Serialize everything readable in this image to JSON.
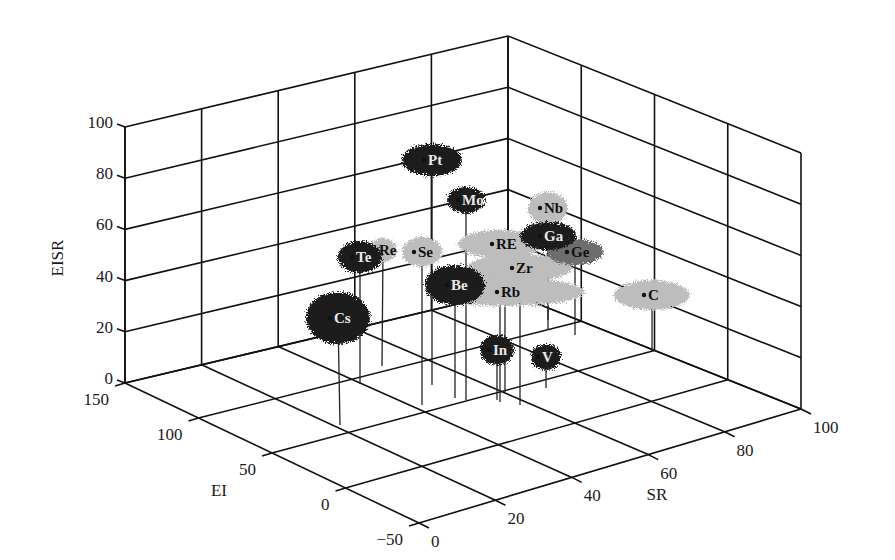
{
  "chart_data": {
    "type": "scatter3d",
    "title": "",
    "xlabel": "SR",
    "ylabel": "EI",
    "zlabel": "EISR",
    "xlim": [
      0,
      100
    ],
    "ylim": [
      -50,
      150
    ],
    "zlim": [
      0,
      100
    ],
    "x_ticks": [
      "0",
      "20",
      "40",
      "60",
      "80",
      "100"
    ],
    "y_ticks": [
      "-50",
      "0",
      "50",
      "100",
      "150"
    ],
    "z_ticks": [
      "0",
      "20",
      "40",
      "60",
      "80",
      "100"
    ],
    "grid": true,
    "legend": null,
    "series_note": "dark clusters and light-gray clusters; each element shown as a fuzzy blob with a drop line to the floor",
    "points": [
      {
        "label": "Pt",
        "shade": "dark",
        "sx": 432,
        "sy": 160,
        "rx": 30,
        "ry": 16,
        "fx": 432,
        "fy": 385
      },
      {
        "label": "Mo",
        "shade": "dark",
        "sx": 466,
        "sy": 200,
        "rx": 19,
        "ry": 13,
        "fx": 466,
        "fy": 400
      },
      {
        "label": "Nb",
        "shade": "light",
        "sx": 548,
        "sy": 208,
        "rx": 20,
        "ry": 16,
        "fx": 548,
        "fy": 330
      },
      {
        "label": "Ga",
        "shade": "dark",
        "sx": 548,
        "sy": 236,
        "rx": 28,
        "ry": 14,
        "fx": 548,
        "fy": 320
      },
      {
        "label": "Ge",
        "shade": "mid",
        "sx": 575,
        "sy": 252,
        "rx": 28,
        "ry": 13,
        "fx": 575,
        "fy": 335
      },
      {
        "label": "RE",
        "shade": "light",
        "sx": 500,
        "sy": 244,
        "rx": 42,
        "ry": 14,
        "fx": 500,
        "fy": 402
      },
      {
        "label": "Te",
        "shade": "dark",
        "sx": 360,
        "sy": 257,
        "rx": 22,
        "ry": 16,
        "fx": 360,
        "fy": 384
      },
      {
        "label": "Re",
        "shade": "light",
        "sx": 383,
        "sy": 250,
        "rx": 14,
        "ry": 12,
        "fx": 382,
        "fy": 366
      },
      {
        "label": "Se",
        "shade": "light",
        "sx": 422,
        "sy": 252,
        "rx": 20,
        "ry": 15,
        "fx": 422,
        "fy": 405
      },
      {
        "label": "Be",
        "shade": "dark",
        "sx": 455,
        "sy": 285,
        "rx": 30,
        "ry": 20,
        "fx": 455,
        "fy": 398
      },
      {
        "label": "Zr",
        "shade": "light",
        "sx": 520,
        "sy": 268,
        "rx": 52,
        "ry": 14,
        "fx": 520,
        "fy": 405
      },
      {
        "label": "Rb",
        "shade": "light",
        "sx": 505,
        "sy": 292,
        "rx": 80,
        "ry": 14,
        "fx": 505,
        "fy": 392
      },
      {
        "label": "C",
        "shade": "light",
        "sx": 652,
        "sy": 295,
        "rx": 38,
        "ry": 15,
        "fx": 652,
        "fy": 352
      },
      {
        "label": "Cs",
        "shade": "dark",
        "sx": 338,
        "sy": 318,
        "rx": 32,
        "ry": 26,
        "fx": 340,
        "fy": 425
      },
      {
        "label": "In",
        "shade": "dark",
        "sx": 497,
        "sy": 350,
        "rx": 17,
        "ry": 15,
        "fx": 497,
        "fy": 400
      },
      {
        "label": "V",
        "shade": "dark",
        "sx": 546,
        "sy": 357,
        "rx": 15,
        "ry": 13,
        "fx": 546,
        "fy": 388
      }
    ]
  },
  "axes": {
    "z_label": "EISR",
    "y_label": "EI",
    "x_label": "SR"
  }
}
